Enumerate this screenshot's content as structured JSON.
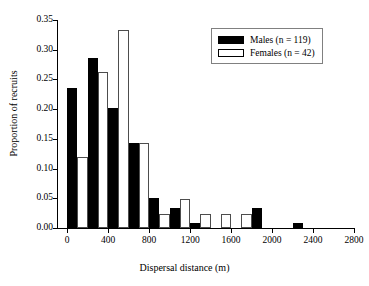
{
  "chart_data": {
    "type": "bar",
    "title": "",
    "xlabel": "Dispersal distance (m)",
    "ylabel": "Proportion of recruits",
    "xlim": [
      -100,
      2800
    ],
    "ylim": [
      0.0,
      0.35
    ],
    "grid": false,
    "legend_position": "top-right",
    "bin_width": 200,
    "xticks": [
      0,
      400,
      800,
      1200,
      1600,
      2000,
      2400,
      2800
    ],
    "xtick_labels": [
      "0",
      "400",
      "800",
      "1200",
      "1600",
      "2000",
      "2400",
      "2800"
    ],
    "yticks": [
      0.0,
      0.05,
      0.1,
      0.15,
      0.2,
      0.25,
      0.3,
      0.35
    ],
    "ytick_labels": [
      "0.00",
      "0.05",
      "0.10",
      "0.15",
      "0.20",
      "0.25",
      "0.30",
      "0.35"
    ],
    "bin_starts": [
      0,
      200,
      400,
      600,
      800,
      1000,
      1200,
      1400,
      1600,
      1800,
      2000,
      2200,
      2400,
      2600
    ],
    "categories": [
      "0",
      "200",
      "400",
      "600",
      "800",
      "1000",
      "1200",
      "1400",
      "1600",
      "1800",
      "2000",
      "2200",
      "2400",
      "2600"
    ],
    "series": [
      {
        "name": "Males (n = 119)",
        "color": "#000000",
        "values": [
          0.236,
          0.286,
          0.202,
          0.143,
          0.05,
          0.034,
          0.008,
          0.0,
          0.0,
          0.034,
          0.0,
          0.008,
          0.0,
          0.0
        ]
      },
      {
        "name": "Females (n = 42)",
        "color": "#ffffff",
        "values": [
          0.119,
          0.262,
          0.333,
          0.143,
          0.024,
          0.048,
          0.024,
          0.024,
          0.024,
          0.0,
          0.0,
          0.0,
          0.0,
          0.0
        ]
      }
    ]
  },
  "legend": {
    "entries": [
      {
        "label": "Males (n = 119)",
        "swatch": "filled-black-swatch"
      },
      {
        "label": "Females (n = 42)",
        "swatch": "outlined-white-swatch"
      }
    ]
  },
  "axes": {
    "x_title": "Dispersal distance (m)",
    "y_title": "Proportion of recruits"
  }
}
